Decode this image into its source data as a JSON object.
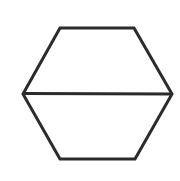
{
  "diagram": {
    "shape": "hexagon",
    "description": "Hexagon divided by a horizontal line into two trapezoids",
    "stroke_color": "#2b2b2b",
    "fill_color": "#ffffff",
    "background_color": "#ffffff",
    "stroke_width": 3,
    "vertices": [
      {
        "x": 60,
        "y": 28
      },
      {
        "x": 134,
        "y": 28
      },
      {
        "x": 172,
        "y": 94
      },
      {
        "x": 135,
        "y": 159
      },
      {
        "x": 60,
        "y": 159
      },
      {
        "x": 23,
        "y": 94
      }
    ],
    "divider": {
      "x1": 23,
      "y1": 93.5,
      "x2": 172,
      "y2": 94
    }
  }
}
